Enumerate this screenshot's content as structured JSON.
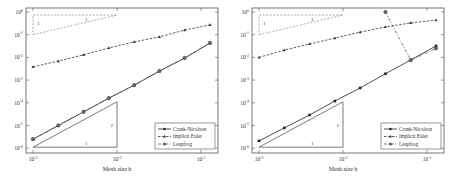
{
  "chart_data": [
    {
      "type": "line",
      "title": "",
      "xlabel": "Mesh size h",
      "ylabel": "",
      "xscale": "log",
      "yscale": "log",
      "xlim": [
        0.00085,
        0.15
      ],
      "ylim": [
        1e-06,
        1
      ],
      "x_ticks": [
        "10^-3",
        "10^-2",
        "10^-1"
      ],
      "y_ticks": [
        "10^0",
        "10^-1",
        "10^-2",
        "10^-3",
        "10^-4",
        "10^-5",
        "10^-6"
      ],
      "grid": false,
      "legend_position": "lower right",
      "x": [
        0.001,
        0.002,
        0.004,
        0.008,
        0.016,
        0.032,
        0.064,
        0.128
      ],
      "series": [
        {
          "name": "Crank-Nicolson",
          "style": "solid",
          "marker": "dot",
          "values": [
            2.5e-06,
            1e-05,
            4e-05,
            0.00016,
            0.0006,
            0.0025,
            0.0094,
            0.043
          ]
        },
        {
          "name": "Implicit Euler",
          "style": "dashed",
          "marker": "triangle",
          "values": [
            0.0038,
            0.0069,
            0.013,
            0.026,
            0.048,
            0.08,
            0.16,
            0.27
          ]
        },
        {
          "name": "Leapfrog",
          "style": "dashdot",
          "marker": "circle",
          "values": [
            2.5e-06,
            1e-05,
            4e-05,
            0.00016,
            0.0006,
            0.0025,
            0.0094,
            0.043
          ]
        }
      ],
      "annotations": [
        {
          "type": "slope-triangle",
          "style": "dashed",
          "labels": [
            "1",
            "1"
          ],
          "slope": 1
        },
        {
          "type": "slope-triangle",
          "style": "solid",
          "labels": [
            "1",
            "2"
          ],
          "slope": 2
        }
      ]
    },
    {
      "type": "line",
      "title": "",
      "xlabel": "Mesh size h",
      "ylabel": "",
      "xscale": "log",
      "yscale": "log",
      "xlim": [
        0.00085,
        0.15
      ],
      "ylim": [
        1e-06,
        1
      ],
      "x_ticks": [
        "10^-3",
        "10^-2",
        "10^-1"
      ],
      "y_ticks": [
        "10^0",
        "10^-1",
        "10^-2",
        "10^-3",
        "10^-4",
        "10^-5",
        "10^-6"
      ],
      "grid": false,
      "legend_position": "lower right",
      "x": [
        0.001,
        0.002,
        0.004,
        0.008,
        0.016,
        0.032,
        0.064,
        0.128
      ],
      "series": [
        {
          "name": "Crank-Nicolson",
          "style": "solid",
          "marker": "dot",
          "values": [
            2.1e-06,
            7.8e-06,
            2.9e-05,
            0.00012,
            0.00045,
            0.0019,
            0.0077,
            0.032
          ]
        },
        {
          "name": "Implicit Euler",
          "style": "dashed",
          "marker": "triangle",
          "values": [
            0.01,
            0.021,
            0.039,
            0.071,
            0.13,
            0.22,
            0.33,
            0.44
          ]
        },
        {
          "name": "Leapfrog",
          "style": "dashdot",
          "marker": "circle",
          "values": [
            null,
            null,
            null,
            null,
            null,
            1.0,
            0.0075,
            0.025
          ]
        }
      ],
      "annotations": [
        {
          "type": "slope-triangle",
          "style": "dashed",
          "labels": [
            "1",
            "1"
          ],
          "slope": 1
        },
        {
          "type": "slope-triangle",
          "style": "solid",
          "labels": [
            "1",
            "2"
          ],
          "slope": 2
        }
      ]
    }
  ],
  "panels": [
    {
      "xlabel": "Mesh size h",
      "legend": [
        "Crank-Nicolson",
        "Implicit Euler",
        "Leapfrog"
      ],
      "triangle_top": {
        "run": "1",
        "rise": "1"
      },
      "triangle_bottom": {
        "run": "1",
        "rise": "2"
      }
    },
    {
      "xlabel": "Mesh size h",
      "legend": [
        "Crank-Nicolson",
        "Implicit Euler",
        "Leapfrog"
      ],
      "triangle_top": {
        "run": "1",
        "rise": "1"
      },
      "triangle_bottom": {
        "run": "1",
        "rise": "2"
      }
    }
  ]
}
